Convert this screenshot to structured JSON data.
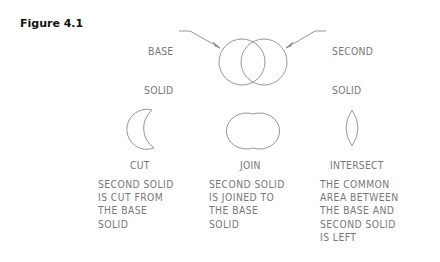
{
  "figure": {
    "label": "Figure 4.1"
  },
  "callouts": {
    "base": {
      "line1": "BASE",
      "line2": "SOLID"
    },
    "second": {
      "line1": "SECOND",
      "line2": "SOLID"
    }
  },
  "operations": [
    {
      "name": "CUT",
      "description": [
        "SECOND SOLID",
        "IS CUT FROM",
        "THE BASE",
        "SOLID"
      ]
    },
    {
      "name": "JOIN",
      "description": [
        "SECOND SOLID",
        "IS JOINED TO",
        "THE BASE",
        "SOLID"
      ]
    },
    {
      "name": "INTERSECT",
      "description": [
        "THE COMMON",
        "AREA BETWEEN",
        "THE BASE AND",
        "SECOND SOLID",
        "IS LEFT"
      ]
    }
  ],
  "colors": {
    "stroke": "#8a8a8a",
    "text": "#777777",
    "title": "#111111"
  }
}
